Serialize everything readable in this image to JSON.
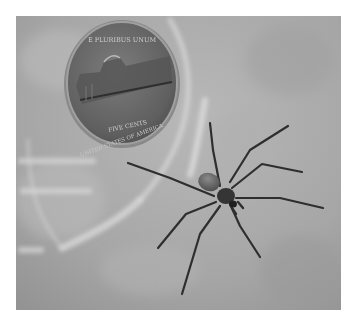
{
  "image": {
    "alt": "Grayscale photo of a spider next to a US nickel inside a clear plastic container",
    "subject": "spider",
    "reference_object": "nickel",
    "color_mode": "grayscale"
  },
  "coin": {
    "top_text": "E PLURIBUS UNUM",
    "denomination": "FIVE CENTS",
    "bottom_text": "UNITED STATES OF AMERICA"
  },
  "colors": {
    "background_light": "#c4c4c4",
    "background_mid": "#a9a9a9",
    "background_dark": "#8e8e8e",
    "coin_face": "#6f6f6f",
    "coin_rim": "#9a9a9a",
    "spider_body": "#3a3a3a",
    "spider_abdomen": "#6a6a6a",
    "spider_legs": "#2e2e2e"
  }
}
